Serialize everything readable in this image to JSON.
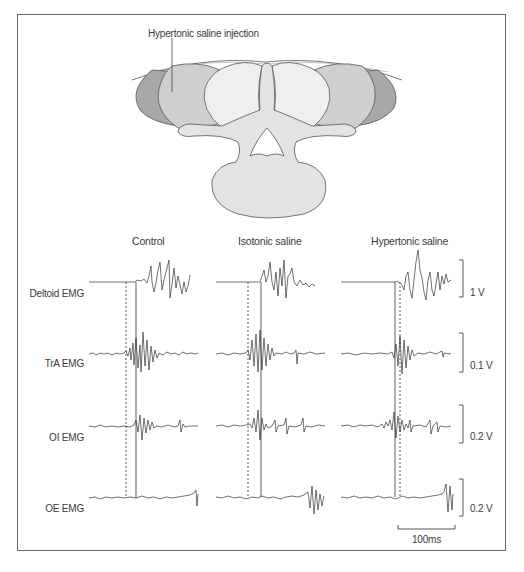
{
  "figure": {
    "annotation": "Hypertonic saline injection",
    "columns": [
      "Control",
      "Isotonic saline",
      "Hypertonic saline"
    ],
    "rows": [
      "Deltoid EMG",
      "TrA EMG",
      "OI EMG",
      "OE EMG"
    ],
    "scale_bars": {
      "deltoid": "1 V",
      "tra": "0.1 V",
      "oi": "0.2 V",
      "oe": "0.2 V",
      "time": "100ms"
    },
    "colors": {
      "muscle_dark": "#a6a6a6",
      "muscle_mid": "#cfcfcf",
      "muscle_light": "#ececec",
      "bone": "#e2e2e2",
      "trace": "#333333",
      "frame": "#6a6a6a"
    }
  }
}
